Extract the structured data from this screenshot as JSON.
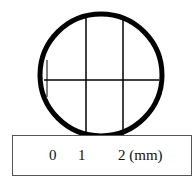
{
  "diagram": {
    "type": "magnified cross-section with scale bar",
    "circle": {
      "cx": 101,
      "cy": 75,
      "rx": 62,
      "ry": 62,
      "stroke": "#000000",
      "stroke_width": 5
    },
    "grid_lines": {
      "vertical_x": [
        86,
        123
      ],
      "horizontal_y": [
        80
      ]
    },
    "scale_bar": {
      "ticks": [
        {
          "label": "0",
          "x": 53
        },
        {
          "label": "1",
          "x": 82
        },
        {
          "label": "2 (mm)",
          "x": 118
        }
      ]
    }
  }
}
